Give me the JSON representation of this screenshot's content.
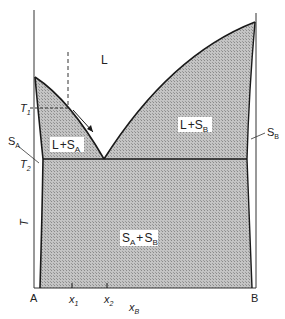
{
  "diagram": {
    "type": "binary eutectic phase diagram",
    "regions": {
      "liquid": "L",
      "liquid_plus_SA": {
        "main": "L",
        "plus": "+",
        "phase": "S",
        "sub": "A"
      },
      "liquid_plus_SB": {
        "main": "L",
        "plus": "+",
        "phase": "S",
        "sub": "B"
      },
      "solid_mix": {
        "a": "S",
        "a_sub": "A",
        "plus": "+",
        "b": "S",
        "b_sub": "B"
      }
    },
    "side_labels": {
      "SA": {
        "main": "S",
        "sub": "A"
      },
      "SB": {
        "main": "S",
        "sub": "B"
      }
    },
    "temperatures": {
      "T1": {
        "main": "T",
        "sub": "1"
      },
      "T2": {
        "main": "T",
        "sub": "2"
      },
      "axis": "T"
    },
    "x_axis": {
      "left": "A",
      "right": "B",
      "x1": {
        "main": "x",
        "sub": "1"
      },
      "x2": {
        "main": "x",
        "sub": "2"
      },
      "label": {
        "main": "x",
        "sub": "B"
      }
    },
    "colors": {
      "line": "#1a1a1a",
      "fill": "#b8b8b8",
      "background": "#ffffff"
    }
  }
}
